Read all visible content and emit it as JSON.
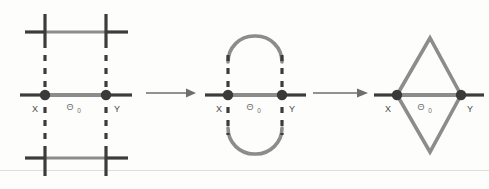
{
  "figure": {
    "title": "",
    "background_color": "#fdfdfb",
    "colors": {
      "dark_stroke": "#3c3c3c",
      "gray_stroke": "#8c8c8c",
      "node_fill": "#3a3a3a",
      "label_text": "#4a4a4a",
      "theta_text": "#707070",
      "rule_line": "#dedede"
    },
    "panels": [
      {
        "id": "panel-crossing",
        "description": "crossing-lines-configuration",
        "node_left_label": "X",
        "node_right_label": "Y",
        "edge_label": "Θ",
        "edge_label_subscript": "0"
      },
      {
        "id": "panel-stadium",
        "description": "stadium-capsule-loop-configuration",
        "node_left_label": "X",
        "node_right_label": "Y",
        "edge_label": "Θ",
        "edge_label_subscript": "0"
      },
      {
        "id": "panel-rhombus",
        "description": "rhombus-bigon-configuration",
        "node_left_label": "X",
        "node_right_label": "Y",
        "edge_label": "Θ",
        "edge_label_subscript": "0"
      }
    ],
    "arrows": [
      {
        "id": "arrow-1",
        "from": "panel-crossing",
        "to": "panel-stadium",
        "label": ""
      },
      {
        "id": "arrow-2",
        "from": "panel-stadium",
        "to": "panel-rhombus",
        "label": ""
      }
    ]
  }
}
